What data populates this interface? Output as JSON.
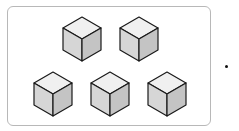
{
  "diagram": {
    "rows": [
      {
        "count": 2
      },
      {
        "count": 3
      }
    ],
    "total_cubes": 5,
    "colors": {
      "frame_border": "#b8b8b8",
      "cube_top": "#f0f0f0",
      "cube_left": "#d6d6d6",
      "cube_right": "#c4c4c4",
      "cube_edge": "#1a1a1a"
    },
    "trailing_mark": "•"
  }
}
